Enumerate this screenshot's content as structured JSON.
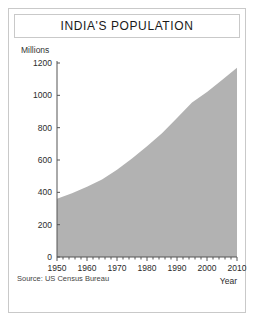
{
  "card": {
    "title": "INDIA'S POPULATION",
    "source": "Source: US Census Bureau"
  },
  "chart_data": {
    "type": "area",
    "title": "INDIA'S POPULATION",
    "xlabel": "Year",
    "ylabel": "Millions",
    "unit_label": "Millions",
    "xlim": [
      1950,
      2010
    ],
    "ylim": [
      0,
      1200
    ],
    "grid": false,
    "legend": "none",
    "fill_color": "#b2b2b2",
    "axis_color": "#555555",
    "xticks": [
      1950,
      1960,
      1970,
      1980,
      1990,
      2000,
      2010
    ],
    "xtick_labels": [
      "1950",
      "1960",
      "1970",
      "1980",
      "1990",
      "2000",
      "2010"
    ],
    "xminor_step": 2,
    "yticks": [
      0,
      200,
      400,
      600,
      800,
      1000,
      1200
    ],
    "ytick_labels": [
      "0",
      "200",
      "400",
      "600",
      "800",
      "1000",
      "1200"
    ],
    "x": [
      1950,
      1955,
      1960,
      1965,
      1970,
      1975,
      1980,
      1985,
      1990,
      1995,
      2000,
      2005,
      2010
    ],
    "values": [
      360,
      395,
      435,
      480,
      540,
      610,
      685,
      765,
      860,
      955,
      1020,
      1095,
      1170
    ],
    "series": [
      {
        "name": "Population (millions)",
        "values": [
          360,
          395,
          435,
          480,
          540,
          610,
          685,
          765,
          860,
          955,
          1020,
          1095,
          1170
        ]
      }
    ],
    "source": "Source: US Census Bureau"
  }
}
